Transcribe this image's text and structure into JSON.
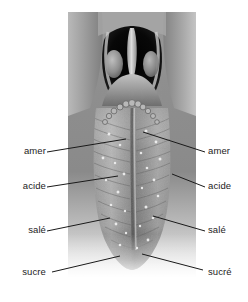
{
  "figure": {
    "background_color": "#ffffff",
    "label_color": "#1c1c1c",
    "leader_color": "#1a1a1a"
  },
  "photo": {
    "description": "Photographie en niveaux de gris de la langue et de l'oropharynx",
    "grayscale": true,
    "regions": [
      "oropharynx",
      "uvula",
      "tonsil-left",
      "tonsil-right",
      "circumvallate-papillae",
      "median-sulcus",
      "tongue-body",
      "tongue-tip"
    ],
    "tone_dark": "#1a1a1a",
    "tone_mid": "#8d8d8d",
    "tone_light": "#d8d8d8"
  },
  "labels": {
    "left": [
      {
        "id": "amer-left",
        "text": "amer"
      },
      {
        "id": "acide-left",
        "text": "acide"
      },
      {
        "id": "sale-left",
        "text": "salé"
      },
      {
        "id": "sucre-left",
        "text": "sucre"
      }
    ],
    "right": [
      {
        "id": "amer-right",
        "text": "amer"
      },
      {
        "id": "acide-right",
        "text": "acide"
      },
      {
        "id": "sale-right",
        "text": "salé"
      },
      {
        "id": "sucre-right",
        "text": "sucré"
      }
    ]
  },
  "leader_lines": [
    {
      "id": "leader-amer-left",
      "from": [
        47,
        152
      ],
      "to": [
        126,
        139
      ]
    },
    {
      "id": "leader-acide-left",
      "from": [
        47,
        187
      ],
      "to": [
        118,
        176
      ]
    },
    {
      "id": "leader-sale-left",
      "from": [
        47,
        231
      ],
      "to": [
        110,
        218
      ]
    },
    {
      "id": "leader-sucre-left",
      "from": [
        52,
        272
      ],
      "to": [
        120,
        256
      ]
    },
    {
      "id": "leader-amer-right",
      "from": [
        205,
        152
      ],
      "to": [
        143,
        132
      ]
    },
    {
      "id": "leader-acide-right",
      "from": [
        205,
        187
      ],
      "to": [
        172,
        174
      ]
    },
    {
      "id": "leader-sale-right",
      "from": [
        205,
        231
      ],
      "to": [
        153,
        216
      ]
    },
    {
      "id": "leader-sucre-right",
      "from": [
        203,
        270
      ],
      "to": [
        142,
        254
      ]
    }
  ]
}
